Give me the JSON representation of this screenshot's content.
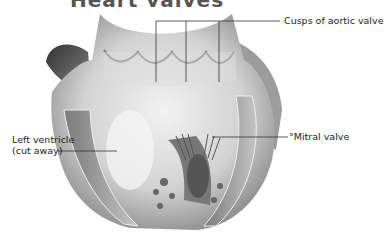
{
  "title": "Heart valves",
  "labels": {
    "aortic": "Cusps of aortic valve",
    "mitral": "°Mitral valve",
    "ventricle_line1": "Left ventricle",
    "ventricle_line2": "(cut away)"
  },
  "colors": {
    "line": "#333333",
    "tissue_light": "#e6e6e6",
    "tissue_mid": "#b0b0b0",
    "tissue_dark": "#555555"
  }
}
